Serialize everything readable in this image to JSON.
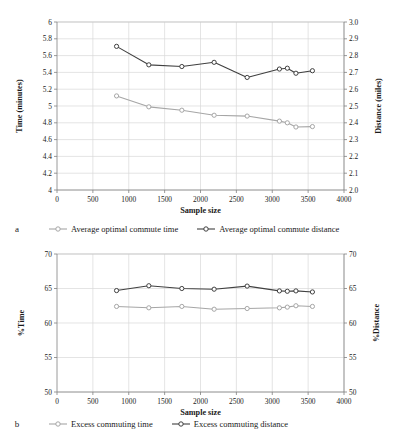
{
  "figure": {
    "panels": [
      {
        "letter": "a",
        "legend": [
          {
            "label": "Average optimal commute time",
            "color": "#a6a6a6",
            "marker": "open-circle"
          },
          {
            "label": "Average optimal commute distance",
            "color": "#404040",
            "marker": "open-circle"
          }
        ]
      },
      {
        "letter": "b",
        "legend": [
          {
            "label": "Excess commuting time",
            "color": "#a6a6a6",
            "marker": "open-circle"
          },
          {
            "label": "Excess commuting distance",
            "color": "#404040",
            "marker": "open-circle"
          }
        ]
      }
    ]
  },
  "chart_data": [
    {
      "type": "line",
      "panel": "a",
      "title": "",
      "xlabel": "Sample size",
      "ylabel": "Time (minutes)",
      "y2label": "Distance  (miles)",
      "xlim": [
        0,
        4000
      ],
      "xticks": [
        0,
        500,
        1000,
        1500,
        2000,
        2500,
        3000,
        3500,
        4000
      ],
      "ylim": [
        4,
        6
      ],
      "yticks": [
        4,
        4.2,
        4.4,
        4.6,
        4.8,
        5,
        5.2,
        5.4,
        5.6,
        5.8,
        6
      ],
      "ytick_labels": [
        "4",
        "4.2",
        "4.4",
        "4.6",
        "4.8",
        "5",
        "5.2",
        "5.4",
        "5.6",
        "5.8",
        "6"
      ],
      "y2lim": [
        2.0,
        3.0
      ],
      "y2ticks": [
        2.0,
        2.1,
        2.2,
        2.3,
        2.4,
        2.5,
        2.6,
        2.7,
        2.8,
        2.9,
        3.0
      ],
      "y2tick_labels": [
        "2.0",
        "2.1",
        "2.2",
        "2.3",
        "2.4",
        "2.5",
        "2.6",
        "2.7",
        "2.8",
        "2.9",
        "3.0"
      ],
      "grid": true,
      "legend_position": "bottom",
      "x": [
        830,
        1280,
        1740,
        2190,
        2650,
        3100,
        3210,
        3330,
        3560
      ],
      "series": [
        {
          "name": "Average optimal commute time",
          "axis": "left",
          "color": "#a6a6a6",
          "values": [
            5.12,
            4.99,
            4.95,
            4.89,
            4.88,
            4.82,
            4.8,
            4.75,
            4.755
          ]
        },
        {
          "name": "Average optimal commute distance",
          "axis": "right",
          "color": "#404040",
          "values": [
            2.855,
            2.745,
            2.735,
            2.76,
            2.67,
            2.72,
            2.725,
            2.695,
            2.71
          ]
        }
      ]
    },
    {
      "type": "line",
      "panel": "b",
      "title": "",
      "xlabel": "Sample size",
      "ylabel": "%Time",
      "y2label": "%Distance",
      "xlim": [
        0,
        4000
      ],
      "xticks": [
        0,
        500,
        1000,
        1500,
        2000,
        2500,
        3000,
        3500,
        4000
      ],
      "ylim": [
        50,
        70
      ],
      "yticks": [
        50,
        55,
        60,
        65,
        70
      ],
      "ytick_labels": [
        "50",
        "55",
        "60",
        "65",
        "70"
      ],
      "y2lim": [
        50,
        70
      ],
      "y2ticks": [
        50,
        55,
        60,
        65,
        70
      ],
      "y2tick_labels": [
        "50",
        "55",
        "60",
        "65",
        "70"
      ],
      "grid": true,
      "legend_position": "bottom",
      "x": [
        830,
        1280,
        1740,
        2190,
        2650,
        3100,
        3210,
        3330,
        3560
      ],
      "series": [
        {
          "name": "Excess commuting time",
          "axis": "left",
          "color": "#a6a6a6",
          "values": [
            62.4,
            62.2,
            62.4,
            62.0,
            62.1,
            62.2,
            62.3,
            62.5,
            62.4
          ]
        },
        {
          "name": "Excess commuting distance",
          "axis": "right",
          "color": "#404040",
          "values": [
            64.7,
            65.4,
            65.0,
            64.9,
            65.35,
            64.65,
            64.6,
            64.65,
            64.5
          ]
        }
      ]
    }
  ]
}
